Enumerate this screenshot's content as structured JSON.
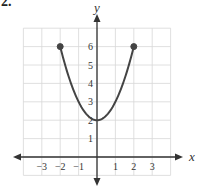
{
  "problem": {
    "number": "2."
  },
  "chart_data": {
    "type": "line",
    "title": "",
    "xlabel": "x",
    "ylabel": "y",
    "function": "y = x^2 + 2",
    "domain": [
      -2,
      2
    ],
    "xlim": [
      -4,
      4
    ],
    "ylim": [
      -1,
      7
    ],
    "grid": true,
    "x_ticks": [
      -3,
      -2,
      -1,
      1,
      2,
      3
    ],
    "x_tick_labels": [
      "−3",
      "−2",
      "−1",
      "1",
      "2",
      "3"
    ],
    "y_ticks": [
      1,
      2,
      3,
      4,
      5,
      6
    ],
    "y_tick_labels": [
      "1",
      "2",
      "3",
      "4",
      "5",
      "6"
    ],
    "series": [
      {
        "name": "curve",
        "x": [
          -2,
          -1.5,
          -1,
          -0.5,
          0,
          0.5,
          1,
          1.5,
          2
        ],
        "y": [
          6,
          4.25,
          3,
          2.25,
          2,
          2.25,
          3,
          4.25,
          6
        ],
        "color": "#444444"
      }
    ],
    "endpoints": [
      {
        "x": -2,
        "y": 6,
        "closed": true
      },
      {
        "x": 2,
        "y": 6,
        "closed": true
      }
    ]
  }
}
